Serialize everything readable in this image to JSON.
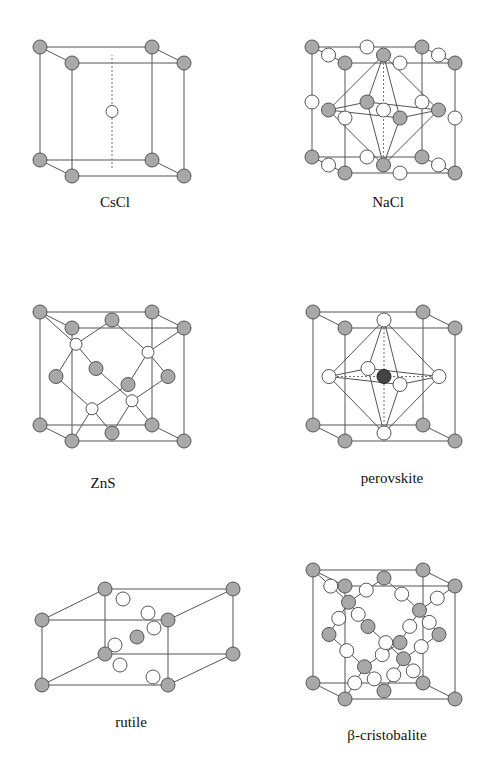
{
  "figure": {
    "structures": [
      {
        "id": "cscl",
        "label": "CsCl"
      },
      {
        "id": "nacl",
        "label": "NaCl"
      },
      {
        "id": "zns",
        "label": "ZnS"
      },
      {
        "id": "perovskite",
        "label": "perovskite"
      },
      {
        "id": "rutile",
        "label": "rutile"
      },
      {
        "id": "cristobalite",
        "label": "β-cristobalite"
      }
    ],
    "colors": {
      "atom_shaded": "#a8a8a8",
      "atom_open": "#ffffff",
      "atom_dark": "#444444",
      "line": "#555555"
    }
  }
}
